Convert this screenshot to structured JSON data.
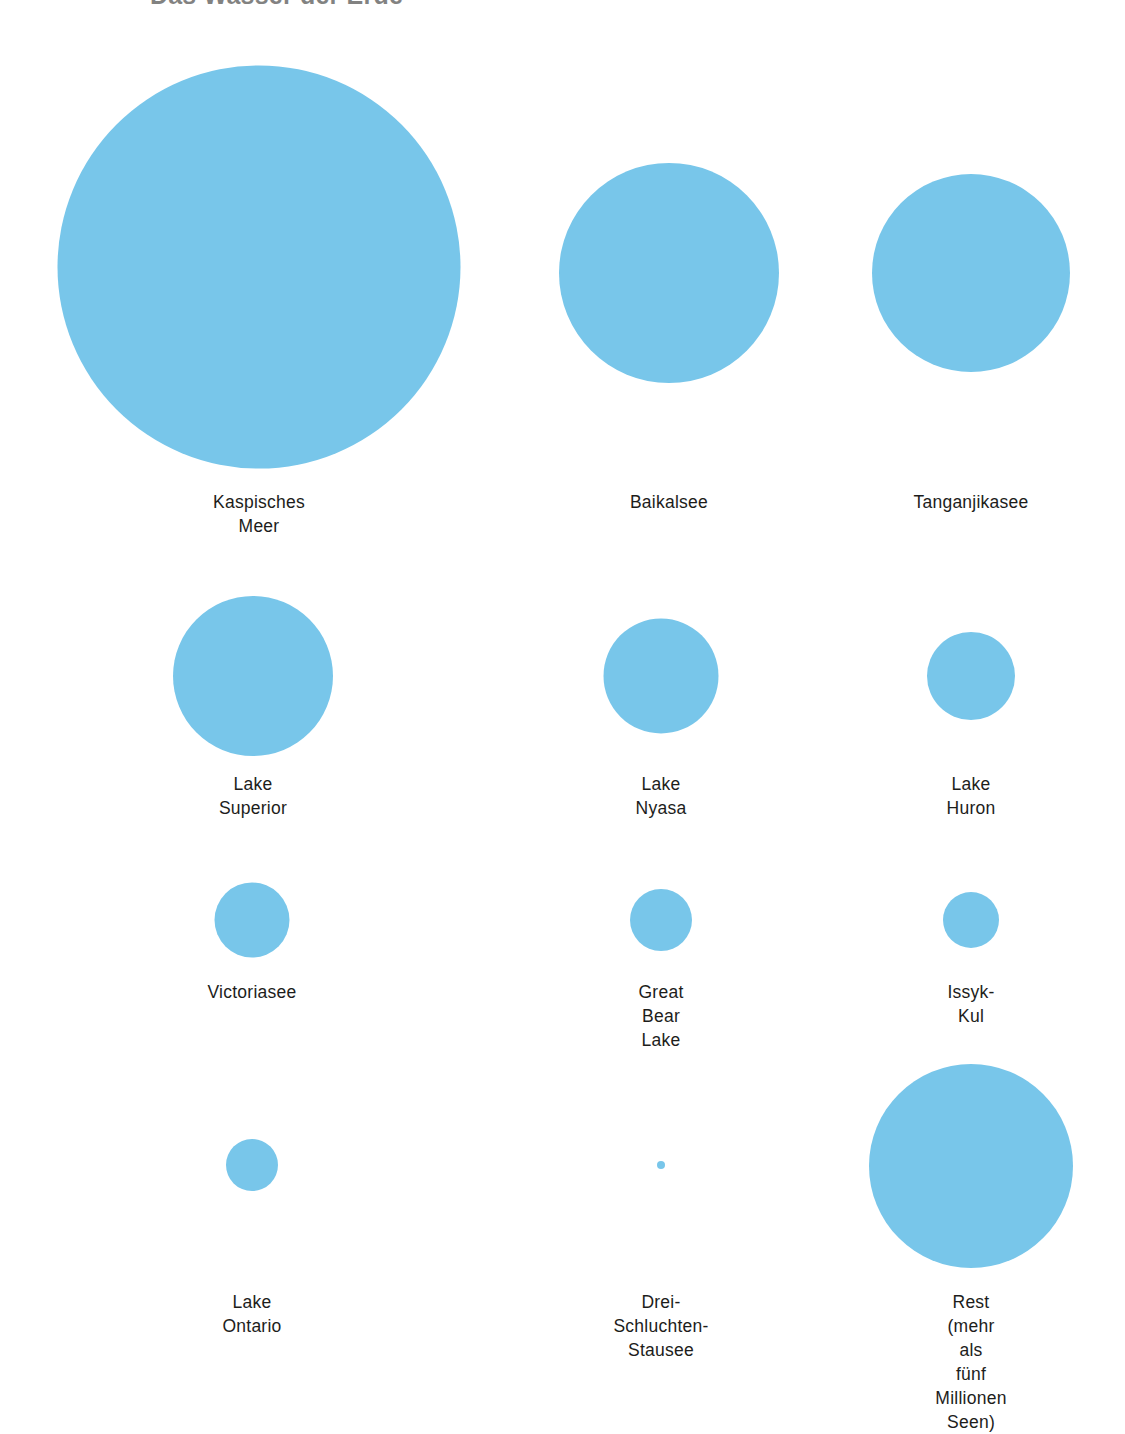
{
  "header": {
    "title": "Das Wasser der Erde",
    "note": "Überschrift ist am oberen Bildrand abgeschnitten"
  },
  "theme": {
    "background_color": "#ffffff",
    "bubble_color": "#78c6ea",
    "label_color": "#1d1d1b"
  },
  "chart_data": {
    "type": "bubble",
    "title": "Das Wasser der Erde",
    "xlabel": "",
    "ylabel": "",
    "grid": false,
    "legend": "none",
    "units": "relative Fläche (Wasservolumen)",
    "categories": [
      "Kaspisches Meer",
      "Baikalsee",
      "Tanganjikasee",
      "Lake Superior",
      "Lake Nyasa",
      "Lake Huron",
      "Victoriasee",
      "Great Bear Lake",
      "Issyk-Kul",
      "Lake Ontario",
      "Drei-Schluchten-Stausee",
      "Rest (mehr als\nfünf Millionen Seen)"
    ],
    "values": [
      403,
      220,
      198,
      160,
      115,
      88,
      75,
      62,
      56,
      52,
      8,
      204
    ],
    "bubbles": [
      {
        "label": "Kaspisches Meer",
        "diameter": 403,
        "cx": 259,
        "cy": 267,
        "label_y": 490,
        "col": 0,
        "row": 0
      },
      {
        "label": "Baikalsee",
        "diameter": 220,
        "cx": 669,
        "cy": 273,
        "label_y": 490,
        "col": 1,
        "row": 0
      },
      {
        "label": "Tanganjikasee",
        "diameter": 198,
        "cx": 971,
        "cy": 273,
        "label_y": 490,
        "col": 2,
        "row": 0
      },
      {
        "label": "Lake Superior",
        "diameter": 160,
        "cx": 253,
        "cy": 676,
        "label_y": 772,
        "col": 0,
        "row": 1
      },
      {
        "label": "Lake Nyasa",
        "diameter": 115,
        "cx": 661,
        "cy": 676,
        "label_y": 772,
        "col": 1,
        "row": 1
      },
      {
        "label": "Lake Huron",
        "diameter": 88,
        "cx": 971,
        "cy": 676,
        "label_y": 772,
        "col": 2,
        "row": 1
      },
      {
        "label": "Victoriasee",
        "diameter": 75,
        "cx": 252,
        "cy": 920,
        "label_y": 980,
        "col": 0,
        "row": 2
      },
      {
        "label": "Great Bear Lake",
        "diameter": 62,
        "cx": 661,
        "cy": 920,
        "label_y": 980,
        "col": 1,
        "row": 2
      },
      {
        "label": "Issyk-Kul",
        "diameter": 56,
        "cx": 971,
        "cy": 920,
        "label_y": 980,
        "col": 2,
        "row": 2
      },
      {
        "label": "Lake Ontario",
        "diameter": 52,
        "cx": 252,
        "cy": 1165,
        "label_y": 1290,
        "col": 0,
        "row": 3
      },
      {
        "label": "Drei-Schluchten-Stausee",
        "diameter": 8,
        "cx": 661,
        "cy": 1165,
        "label_y": 1290,
        "col": 1,
        "row": 3
      },
      {
        "label": "Rest (mehr als\nfünf Millionen Seen)",
        "diameter": 204,
        "cx": 971,
        "cy": 1166,
        "label_y": 1290,
        "col": 2,
        "row": 3
      }
    ]
  }
}
